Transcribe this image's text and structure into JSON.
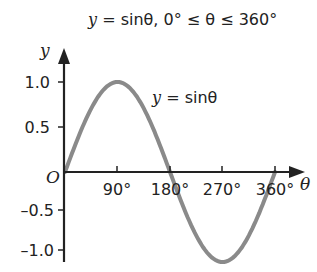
{
  "chart_data": {
    "type": "line",
    "title": "y = sinθ, 0° ≤ θ ≤ 360°",
    "xlabel": "θ",
    "ylabel": "y",
    "x_ticks": [
      "90°",
      "180°",
      "270°",
      "360°"
    ],
    "y_ticks": [
      "1.0",
      "0.5",
      "-0.5",
      "-1.0"
    ],
    "origin_label": "O",
    "xlim": [
      0,
      360
    ],
    "ylim": [
      -1.0,
      1.0
    ],
    "grid": false,
    "series": [
      {
        "name": "y = sinθ",
        "x": [
          0,
          90,
          180,
          270,
          360
        ],
        "values": [
          0,
          1,
          0,
          -1,
          0
        ],
        "color": "#8a8a8a"
      }
    ],
    "annotations": [
      "y = sinθ"
    ]
  },
  "title": {
    "prefix": "y",
    "rest": " = sinθ, 0° ≤ θ ≤ 360°"
  },
  "curve_label": {
    "prefix": "y",
    "rest": " = sinθ"
  },
  "axes": {
    "x_label": "θ",
    "y_label": "y",
    "origin": "O",
    "x_ticks": [
      "90°",
      "180°",
      "270°",
      "360°"
    ],
    "y_ticks": [
      "1.0",
      "0.5",
      "–0.5",
      "–1.0"
    ]
  }
}
